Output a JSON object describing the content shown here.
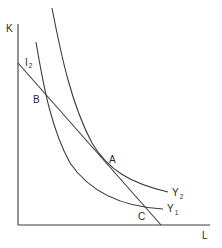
{
  "diagram": {
    "type": "isoquant-isocost",
    "axes": {
      "y_label": "K",
      "x_label": "L"
    },
    "isocost_line": {
      "label": "I",
      "subscript": "2"
    },
    "isoquants": [
      {
        "label": "Y",
        "subscript": "1"
      },
      {
        "label": "Y",
        "subscript": "2"
      }
    ],
    "points": [
      {
        "label": "A",
        "description": "tangency of isocost line I2 with isoquant Y2"
      },
      {
        "label": "B",
        "description": "upper intersection of I2 with Y1"
      },
      {
        "label": "C",
        "description": "lower intersection of I2 with Y1"
      }
    ],
    "colors": {
      "line": "#3a3a3a",
      "background": "#ffffff"
    }
  }
}
